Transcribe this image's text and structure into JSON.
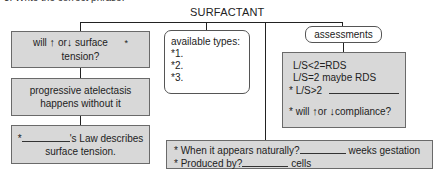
{
  "intro_text": "3. Write the correct phrase.",
  "title": "SURFACTANT",
  "colors": {
    "box_fill": "#d8d8d8",
    "box_border": "#6a6a6a",
    "line": "#222222"
  },
  "left_column": {
    "box1": {
      "pre": "will",
      "up_icon": "↑",
      "mid": "or",
      "down_icon": "↓",
      "post": "surface",
      "star": "*",
      "line2": "tension?"
    },
    "box2": {
      "line1": "progressive atelectasis",
      "line2": "happens without it"
    },
    "box3": {
      "star": "*",
      "line1_post": "'s Law describes",
      "line2": "surface tension."
    }
  },
  "types_box": {
    "heading": "available types:",
    "items": [
      "*1.",
      "*2.",
      "*3."
    ]
  },
  "assessments": {
    "label": "assessments",
    "lines": [
      "L/S<2=RDS",
      "L/S=2 maybe RDS"
    ],
    "line3_pre": "* L/S>2",
    "line4": {
      "pre": "* will",
      "up_icon": "↑",
      "mid": "or",
      "down_icon": "↓",
      "post": "compliance?"
    }
  },
  "bottom_box": {
    "line1": {
      "pre": "* When it appears naturally?",
      "post": "weeks gestation"
    },
    "line2": {
      "pre": "* Produced by?",
      "post": "cells"
    }
  }
}
